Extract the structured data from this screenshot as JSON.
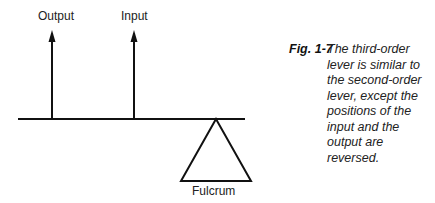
{
  "diagram": {
    "labels": {
      "output": "Output",
      "input": "Input",
      "fulcrum": "Fulcrum"
    }
  },
  "caption": {
    "fig_label": "Fig. 1-7",
    "text": "The third-order lever is similar to the second-order lever, except the positions of the input and the output are reversed."
  }
}
